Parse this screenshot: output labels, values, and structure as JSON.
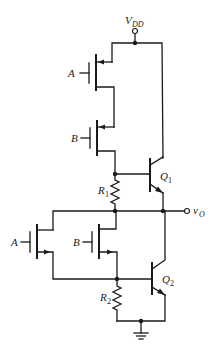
{
  "diagram": {
    "type": "circuit-schematic",
    "labels": {
      "supply": {
        "main": "V",
        "sub": "DD"
      },
      "output": {
        "main": "v",
        "sub": "O"
      },
      "pmos_a_gate": "A",
      "pmos_b_gate": "B",
      "nmos_a_gate": "A",
      "nmos_b_gate": "B",
      "q1": {
        "main": "Q",
        "sub": "1"
      },
      "q2": {
        "main": "Q",
        "sub": "2"
      },
      "r1": {
        "main": "R",
        "sub": "1"
      },
      "r2": {
        "main": "R",
        "sub": "2"
      }
    },
    "components": [
      {
        "id": "pmos-a",
        "type": "PMOS",
        "gate": "A"
      },
      {
        "id": "pmos-b",
        "type": "PMOS",
        "gate": "B"
      },
      {
        "id": "nmos-a",
        "type": "NMOS",
        "gate": "A"
      },
      {
        "id": "nmos-b",
        "type": "NMOS",
        "gate": "B"
      },
      {
        "id": "q1",
        "type": "NPN BJT"
      },
      {
        "id": "q2",
        "type": "NPN BJT"
      },
      {
        "id": "r1",
        "type": "resistor"
      },
      {
        "id": "r2",
        "type": "resistor"
      },
      {
        "id": "gnd",
        "type": "ground"
      }
    ],
    "colors": {
      "ink": "#1a1a1a",
      "background": "#ffffff"
    }
  }
}
